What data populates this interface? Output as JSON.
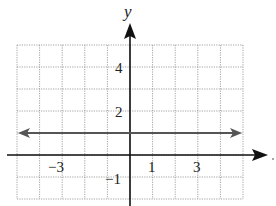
{
  "chart_data": {
    "type": "line",
    "title": "",
    "xlabel": "",
    "ylabel": "y",
    "xlim": [
      -5,
      5
    ],
    "ylim": [
      -2,
      5
    ],
    "grid": true,
    "x_tick_labels": [
      "-3",
      "1",
      "3"
    ],
    "y_tick_labels": [
      "4",
      "2",
      "-1"
    ],
    "series": [
      {
        "name": "y = 1",
        "x": [
          -5,
          5
        ],
        "y": [
          1,
          1
        ],
        "arrows": "both"
      }
    ]
  },
  "labels": {
    "y_axis": "y",
    "x_ticks": {
      "neg3": "−3",
      "pos1": "1",
      "pos3": "3"
    },
    "y_ticks": {
      "pos4": "4",
      "pos2": "2",
      "neg1": "−1"
    }
  }
}
